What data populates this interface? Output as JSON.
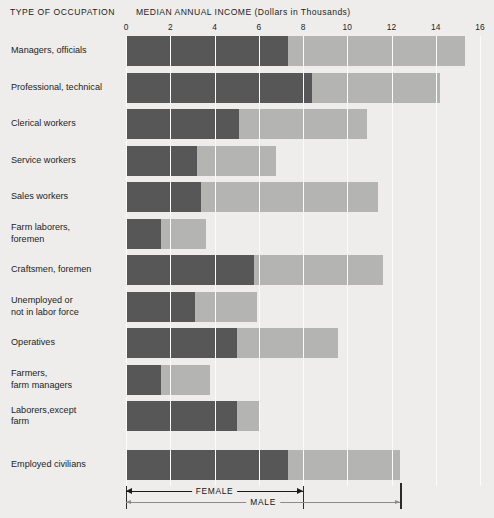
{
  "header": {
    "occupation_title": "TYPE OF OCCUPATION",
    "income_title": "MEDIAN ANNUAL INCOME (Dollars in Thousands)"
  },
  "legend": {
    "female_label": "FEMALE",
    "male_label": "MALE",
    "female_end": 8,
    "male_end": 12.4
  },
  "colors": {
    "female": "#575757",
    "male": "#b4b4b3",
    "background": "#eeedeb",
    "gridline": "#fbfbfa"
  },
  "chart_data": {
    "type": "bar",
    "orientation": "horizontal",
    "stacked": true,
    "title": "MEDIAN ANNUAL INCOME (Dollars in Thousands)",
    "xlabel": "MEDIAN ANNUAL INCOME (Dollars in Thousands)",
    "ylabel": "TYPE OF OCCUPATION",
    "xlim": [
      0,
      16
    ],
    "xticks": [
      0,
      2,
      4,
      6,
      8,
      10,
      12,
      14,
      16
    ],
    "xtick_labels": [
      "0",
      "2",
      "4",
      "6",
      "8",
      "10",
      "12",
      "14",
      "16"
    ],
    "grid": true,
    "legend_position": "bottom",
    "categories": [
      "Managers, officials",
      "Professional, technical",
      "Clerical workers",
      "Service workers",
      "Sales workers",
      "Farm laborers, foremen",
      "Craftsmen, foremen",
      "Unemployed or not in labor force",
      "Operatives",
      "Farmers, farm managers",
      "Laborers,except farm",
      "Employed civilians"
    ],
    "category_lines": [
      [
        "Managers, officials"
      ],
      [
        "Professional, technical"
      ],
      [
        "Clerical workers"
      ],
      [
        "Service workers"
      ],
      [
        "Sales workers"
      ],
      [
        "Farm laborers,",
        "foremen"
      ],
      [
        "Craftsmen, foremen"
      ],
      [
        "Unemployed or",
        "not in labor force"
      ],
      [
        "Operatives"
      ],
      [
        "Farmers,",
        "farm managers"
      ],
      [
        "Laborers,except",
        "farm"
      ],
      [
        "Employed civilians"
      ]
    ],
    "series": [
      {
        "name": "FEMALE",
        "color": "#575757",
        "values": [
          7.3,
          8.4,
          5.1,
          3.2,
          3.4,
          1.6,
          5.8,
          3.1,
          5.0,
          1.6,
          5.0,
          7.3
        ]
      },
      {
        "name": "MALE",
        "color": "#b4b4b3",
        "values": [
          15.3,
          14.2,
          10.9,
          6.8,
          11.4,
          3.6,
          11.6,
          5.9,
          9.6,
          3.8,
          6.0,
          12.4
        ]
      }
    ]
  }
}
